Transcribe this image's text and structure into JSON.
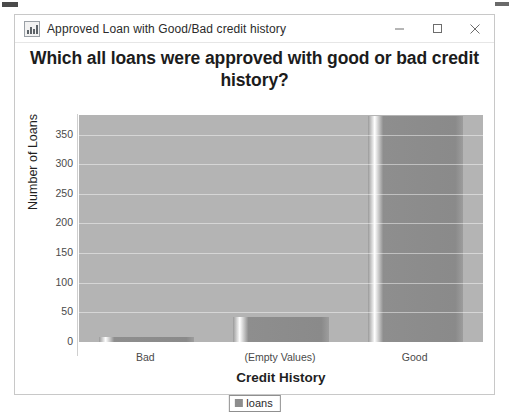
{
  "window": {
    "title": "Approved Loan with Good/Bad credit history",
    "icon": "chart-app-icon",
    "buttons": {
      "minimize": "–",
      "maximize": "□",
      "close": "×"
    }
  },
  "chart_data": {
    "type": "bar",
    "title": "Which all loans were approved with good or bad credit history?",
    "xlabel": "Credit History",
    "ylabel": "Number of Loans",
    "categories": [
      "Bad",
      "(Empty Values)",
      "Good"
    ],
    "values": [
      8,
      42,
      382
    ],
    "series": [
      {
        "name": "loans",
        "values": [
          8,
          42,
          382
        ]
      }
    ],
    "ylim": [
      0,
      383
    ],
    "yticks": [
      0,
      50,
      100,
      150,
      200,
      250,
      300,
      350
    ],
    "ytick_labels": [
      "0",
      "50",
      "100",
      "150",
      "200",
      "250",
      "300",
      "350"
    ],
    "grid": true,
    "legend": [
      "loans"
    ],
    "legend_position": "bottom",
    "plot_background": "#b4b4b4",
    "bar_color": "#8e8e8e"
  }
}
